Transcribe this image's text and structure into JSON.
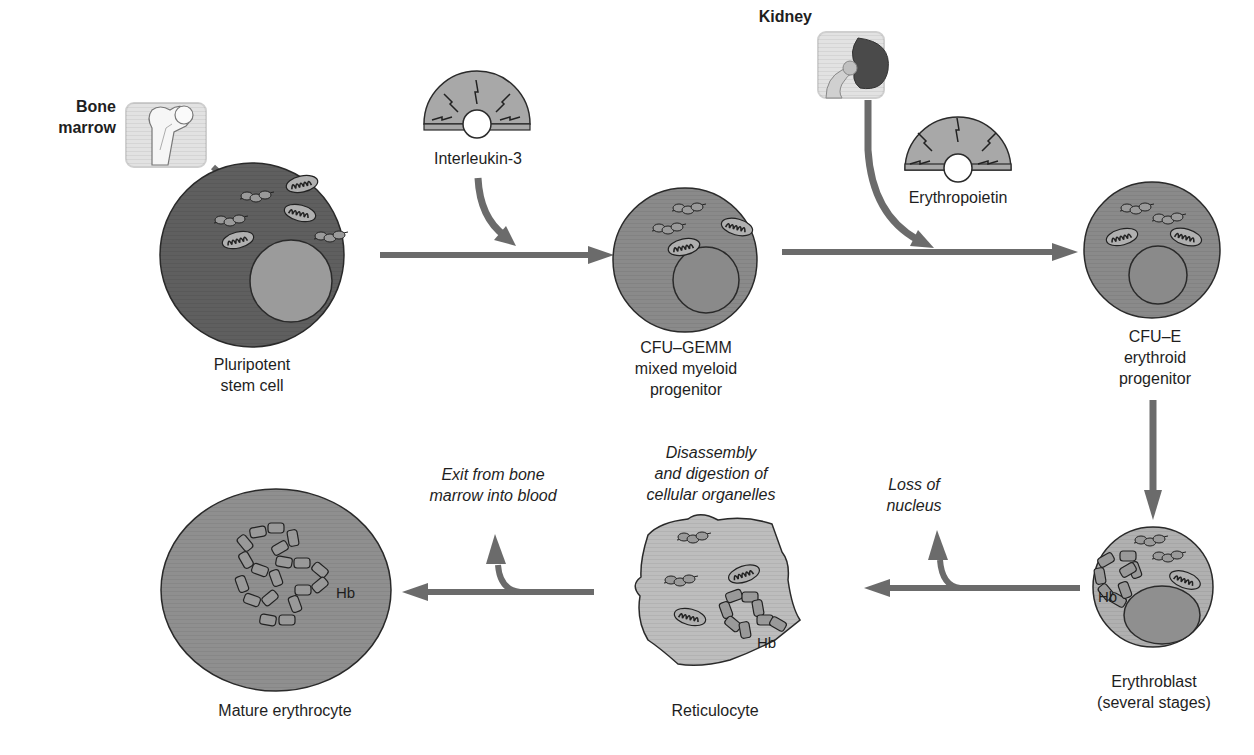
{
  "colors": {
    "arrow": "#6b6b6b",
    "cell_dark": "#5f5f5f",
    "cell_mid": "#8a8a8a",
    "cell_light": "#b4b4b4",
    "nucleus_light": "#9b9b9b",
    "outline": "#2a2a2a",
    "organ_box": "#dcdcdc",
    "organ_box_border": "#c8c8c8"
  },
  "organs": {
    "bone_marrow": {
      "label_line1": "Bone",
      "label_line2": "marrow",
      "icon": "femur-bone-icon"
    },
    "kidney": {
      "label": "Kidney",
      "icon": "kidney-icon"
    }
  },
  "growth_factors": {
    "interleukin": {
      "label": "Interleukin-3",
      "icon": "signal-burst-icon"
    },
    "erythropoietin": {
      "label": "Erythropoietin",
      "icon": "signal-burst-icon"
    }
  },
  "cells": [
    {
      "id": "pluripotent",
      "line1": "Pluripotent",
      "line2": "stem cell",
      "line3": ""
    },
    {
      "id": "cfu_gemm",
      "line1": "CFU–GEMM",
      "line2": "mixed myeloid",
      "line3": "progenitor"
    },
    {
      "id": "cfu_e",
      "line1": "CFU–E",
      "line2": "erythroid",
      "line3": "progenitor"
    },
    {
      "id": "erythroblast",
      "line1": "Erythroblast",
      "line2": "(several stages)",
      "line3": ""
    },
    {
      "id": "reticulocyte",
      "line1": "Reticulocyte",
      "line2": "",
      "line3": ""
    },
    {
      "id": "erythrocyte",
      "line1": "Mature erythrocyte",
      "line2": "",
      "line3": ""
    }
  ],
  "processes": {
    "loss_nucleus": {
      "line1": "Loss of",
      "line2": "nucleus"
    },
    "disassembly": {
      "line1": "Disassembly",
      "line2": "and digestion of",
      "line3": "cellular organelles"
    },
    "exit": {
      "line1": "Exit from bone",
      "line2": "marrow into blood"
    }
  },
  "hb_label": "Hb"
}
